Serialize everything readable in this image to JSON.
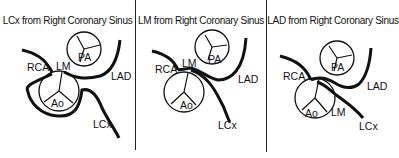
{
  "panels": [
    {
      "title": "LCx from Right Coronary Sinus",
      "labels": {
        "rca": "RCA",
        "lm": "LM",
        "pa": "PA",
        "ao": "Ao",
        "lad": "LAD",
        "lcx": "LCx"
      }
    },
    {
      "title": "LM from Right Coronary Sinus",
      "labels": {
        "rca": "RCA",
        "lm": "LM",
        "pa": "PA",
        "ao": "Ao",
        "lad": "LAD",
        "lcx": "LCx"
      }
    },
    {
      "title": "LAD from Right Coronary Sinus",
      "labels": {
        "rca": "RCA",
        "lm": "LM",
        "pa": "PA",
        "ao": "Ao",
        "lad": "LAD",
        "lcx": "LCx"
      }
    }
  ],
  "colors": {
    "line": "#111111",
    "background": "#ffffff"
  }
}
